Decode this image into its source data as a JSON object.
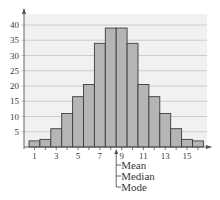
{
  "chart_data": {
    "type": "bar",
    "title": "",
    "xlabel": "",
    "ylabel": "",
    "categories": [
      1,
      2,
      3,
      4,
      5,
      6,
      7,
      8,
      9,
      10,
      11,
      12,
      13,
      14,
      15,
      16
    ],
    "values": [
      2,
      2.5,
      6,
      11,
      16.5,
      20.5,
      34,
      39,
      39,
      34,
      20.5,
      16.5,
      11,
      6,
      2.5,
      2
    ],
    "x_tick_labels": [
      "1",
      "3",
      "5",
      "7",
      "9",
      "11",
      "13",
      "15"
    ],
    "y_ticks": [
      5,
      10,
      15,
      20,
      25,
      30,
      35,
      40
    ],
    "ylim": [
      0,
      44
    ],
    "grid": true,
    "legend": null,
    "annotations": {
      "arrow_position": 8.5,
      "labels": [
        "Mean",
        "Median",
        "Mode"
      ]
    },
    "colors": {
      "bar_fill": "#b5b5b5",
      "bar_stroke": "#3c3c3c",
      "plot_bg": "#f1f1f1",
      "grid": "#c4c4c4",
      "axis": "#555555"
    }
  }
}
